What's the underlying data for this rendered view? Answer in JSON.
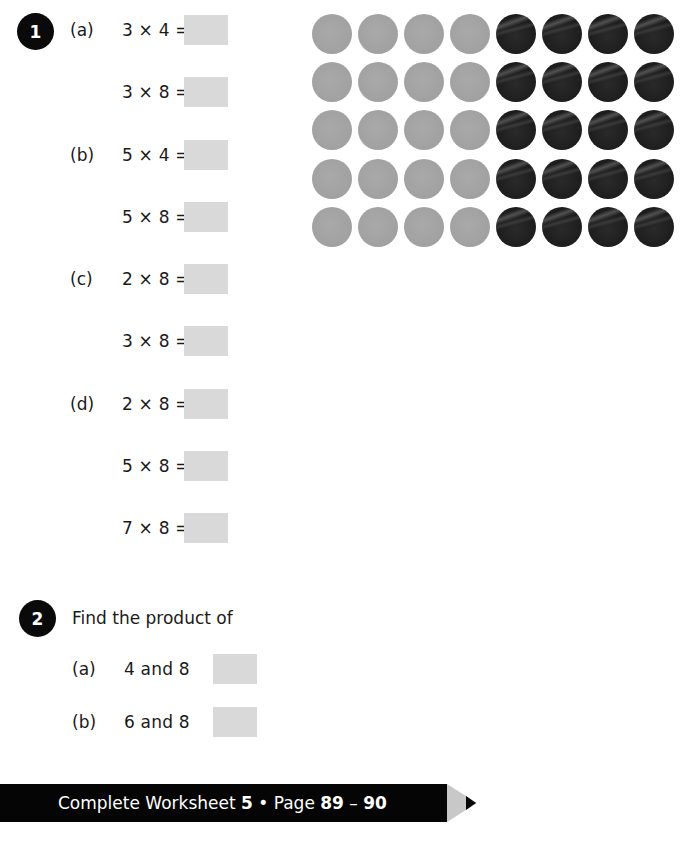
{
  "question1": {
    "number": "1",
    "parts": [
      {
        "label": "(a)",
        "equations": [
          "3 × 4 =",
          "3 × 8 ="
        ]
      },
      {
        "label": "(b)",
        "equations": [
          "5 × 4 =",
          "5 × 8 ="
        ]
      },
      {
        "label": "(c)",
        "equations": [
          "2 × 8 =",
          "3 × 8 ="
        ]
      },
      {
        "label": "(d)",
        "equations": [
          "2 × 8 =",
          "5 × 8 =",
          "7 × 8 ="
        ]
      }
    ],
    "answers": [
      "",
      "",
      "",
      "",
      "",
      "",
      "",
      "",
      ""
    ]
  },
  "dot_array": {
    "rows": 5,
    "columns": 8,
    "grey_per_row": 4,
    "black_per_row": 4,
    "colors": {
      "grey": "#a3a3a3",
      "black": "#1c1c1c"
    }
  },
  "question2": {
    "number": "2",
    "prompt": "Find the product of",
    "parts": [
      {
        "label": "(a)",
        "text": "4 and 8",
        "answer": ""
      },
      {
        "label": "(b)",
        "text": "6 and 8",
        "answer": ""
      }
    ]
  },
  "footer": {
    "prefix": "Complete Worksheet ",
    "worksheet_number": "5",
    "separator": " • Page ",
    "page_start": "89",
    "dash": " – ",
    "page_end": "90"
  },
  "colors": {
    "answer_box": "#d9d9d9",
    "badge": "#0a0a0a",
    "footer_bar": "#050505",
    "pencil_wood": "#c8c8c8"
  }
}
